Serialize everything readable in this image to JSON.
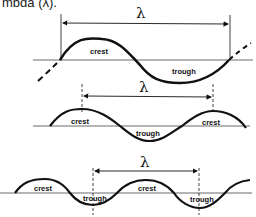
{
  "caption": "mbda (λ).",
  "diagrams": [
    {
      "id": "wave-1",
      "wavelength_symbol": "λ",
      "labels": {
        "crest": "crest",
        "trough": "trough"
      }
    },
    {
      "id": "wave-2",
      "wavelength_symbol": "λ",
      "labels": {
        "crest_left": "crest",
        "trough": "trough",
        "crest_right": "crest"
      }
    },
    {
      "id": "wave-3",
      "wavelength_symbol": "λ",
      "labels": {
        "crest_1": "crest",
        "trough_1": "trough",
        "crest_2": "crest",
        "trough_2": "trough"
      }
    }
  ],
  "colors": {
    "line": "#111111",
    "axis": "#444444"
  }
}
